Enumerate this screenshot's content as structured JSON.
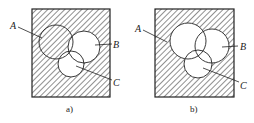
{
  "figure": {
    "panels": [
      {
        "id": "a",
        "caption": "a)",
        "labels": {
          "A": "A",
          "B": "B",
          "C": "C"
        },
        "shaded_regions": [
          "outside all circles",
          "A only (not B, not C)"
        ],
        "colors": {
          "stroke": "#222222",
          "hatch": "#333333",
          "background": "#ffffff"
        }
      },
      {
        "id": "b",
        "caption": "b)",
        "labels": {
          "A": "A",
          "B": "B",
          "C": "C"
        },
        "shaded_regions": [
          "outside all circles"
        ],
        "colors": {
          "stroke": "#222222",
          "hatch": "#333333",
          "background": "#ffffff"
        }
      }
    ]
  }
}
